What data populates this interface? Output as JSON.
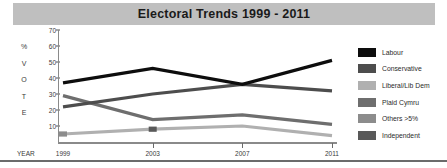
{
  "title": "Electoral Trends 1999 - 2011",
  "axis": {
    "y_title_chars": [
      "%",
      "V",
      "O",
      "T",
      "E"
    ],
    "x_axis_name": "YEAR"
  },
  "legend": {
    "items": [
      {
        "label": "Labour",
        "color": "#0d0d0d"
      },
      {
        "label": "Conservative",
        "color": "#4d4d4d"
      },
      {
        "label": "Liberal/Lib Dem",
        "color": "#b0b0b0"
      },
      {
        "label": "Plaid Cymru",
        "color": "#6e6e6e"
      },
      {
        "label": "Others >5%",
        "color": "#8c8c8c"
      },
      {
        "label": "Independent",
        "color": "#595959"
      }
    ]
  },
  "colors": {
    "title_bar": "#bfbfbf",
    "axis_line": "#8a8a8a",
    "text": "#3a3a3a"
  },
  "chart_data": {
    "type": "line",
    "title": "Electoral Trends 1999 - 2011",
    "xlabel": "YEAR",
    "ylabel": "% VOTE",
    "categories": [
      "1999",
      "2003",
      "2007",
      "2011"
    ],
    "x": [
      1999,
      2003,
      2007,
      2011
    ],
    "ylim": [
      0,
      70
    ],
    "yticks": [
      10,
      20,
      30,
      40,
      50,
      60,
      70
    ],
    "grid": false,
    "legend_position": "right",
    "series": [
      {
        "name": "Labour",
        "color": "#0d0d0d",
        "values": [
          37,
          46,
          36,
          51
        ]
      },
      {
        "name": "Conservative",
        "color": "#4d4d4d",
        "values": [
          22,
          30,
          36,
          32
        ]
      },
      {
        "name": "Plaid Cymru",
        "color": "#6e6e6e",
        "values": [
          29,
          14,
          17,
          11
        ]
      },
      {
        "name": "Liberal/Lib Dem",
        "color": "#b0b0b0",
        "values": [
          5,
          8,
          10,
          4
        ]
      },
      {
        "name": "Others >5%",
        "color": "#8c8c8c",
        "values": [
          5,
          8,
          null,
          null
        ]
      },
      {
        "name": "Independent",
        "color": "#595959",
        "values": [
          5,
          8,
          null,
          null
        ]
      }
    ],
    "markers": [
      {
        "series": "Others >5%",
        "x": "1999",
        "y": 5
      },
      {
        "series": "Independent",
        "x": "2003",
        "y": 8
      }
    ]
  }
}
